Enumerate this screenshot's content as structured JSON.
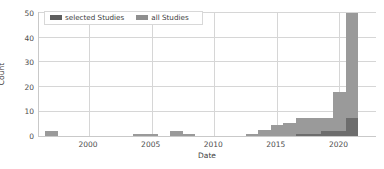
{
  "chart_data": {
    "type": "bar",
    "title": "",
    "xlabel": "Date",
    "ylabel": "Count",
    "xlim": [
      1996,
      2023
    ],
    "ylim": [
      0,
      51
    ],
    "grid": true,
    "legend_position": "upper left",
    "stacked": true,
    "xticks": [
      "2000",
      "2005",
      "2010",
      "2015",
      "2020"
    ],
    "xtick_values": [
      2000,
      2005,
      2010,
      2015,
      2020
    ],
    "yticks": [
      "0",
      "10",
      "20",
      "30",
      "40",
      "50"
    ],
    "ytick_values": [
      0,
      10,
      20,
      30,
      40,
      50
    ],
    "categories": [
      1997,
      1998,
      2004,
      2005,
      2007,
      2008,
      2013,
      2014,
      2015,
      2016,
      2017,
      2018,
      2019,
      2020,
      2021
    ],
    "series": [
      {
        "name": "all Studies",
        "color": "#9a9a9a",
        "values": [
          2,
          0,
          1,
          1,
          2,
          1,
          1,
          2.5,
          4.5,
          5.5,
          7.5,
          7.5,
          7.5,
          18,
          50
        ]
      },
      {
        "name": "selected Studies",
        "color": "#6d6d6d",
        "values": [
          0,
          0,
          0,
          0,
          0,
          0,
          0,
          0,
          0,
          0,
          1,
          1,
          2,
          2,
          7.5
        ]
      }
    ]
  },
  "legend": {
    "entries": [
      {
        "label": "selected Studies",
        "swatch": "selected-studies-swatch"
      },
      {
        "label": "all Studies",
        "swatch": "all-studies-swatch"
      }
    ]
  },
  "axes": {
    "x_label": "Date",
    "y_label": "Count"
  },
  "colors": {
    "all_studies": "#9a9a9a",
    "selected_studies": "#6d6d6d",
    "grid": "#d6d6d6",
    "axis": "#c9c9c9",
    "text": "#4d4d4d",
    "background": "#ffffff"
  }
}
